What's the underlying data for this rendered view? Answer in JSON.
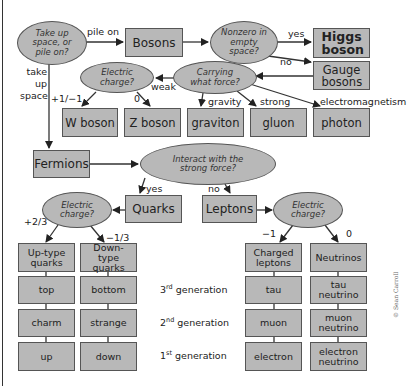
{
  "colors": {
    "node_fill": "#b8b8b8",
    "node_border": "#555555",
    "arrow": "#222222"
  },
  "questions": {
    "space_or_pile": "Take up space, or pile on?",
    "nonzero": "Nonzero in empty space?",
    "carrying_force": "Carrying what force?",
    "boson_charge": "Electric charge?",
    "strong_force": "Interact with the strong force?",
    "quark_charge": "Electric charge?",
    "lepton_charge": "Electric charge?"
  },
  "nodes": {
    "bosons": "Bosons",
    "higgs": "Higgs boson",
    "gauge": "Gauge bosons",
    "w_boson": "W boson",
    "z_boson": "Z boson",
    "graviton": "graviton",
    "gluon": "gluon",
    "photon": "photon",
    "fermions": "Fermions",
    "quarks": "Quarks",
    "leptons": "Leptons"
  },
  "edge_labels": {
    "pile_on": "pile on",
    "take_up_space": "take up space",
    "yes_higgs": "yes",
    "no_gauge": "no",
    "weak": "weak",
    "gravity": "gravity",
    "strong": "strong",
    "electromagnetism": "electromagnetism",
    "w_charge": "+1/−1",
    "z_charge": "0",
    "yes_quarks": "yes",
    "no_leptons": "no",
    "up_charge": "+2/3",
    "down_charge": "−1/3",
    "charged_lepton_charge": "−1",
    "neutrino_charge": "0"
  },
  "quark_table": {
    "headers": [
      "Up-type quarks",
      "Down-type quarks"
    ],
    "rows": [
      [
        "top",
        "bottom"
      ],
      [
        "charm",
        "strange"
      ],
      [
        "up",
        "down"
      ]
    ]
  },
  "lepton_table": {
    "headers": [
      "Charged leptons",
      "Neutrinos"
    ],
    "rows": [
      [
        "tau",
        "tau neutrino"
      ],
      [
        "muon",
        "muon neutrino"
      ],
      [
        "electron",
        "electron neutrino"
      ]
    ]
  },
  "generations": [
    {
      "num": "3",
      "sup": "rd",
      "label": "generation"
    },
    {
      "num": "2",
      "sup": "nd",
      "label": "generation"
    },
    {
      "num": "1",
      "sup": "st",
      "label": "generation"
    }
  ],
  "credit": "© Sean Carroll"
}
